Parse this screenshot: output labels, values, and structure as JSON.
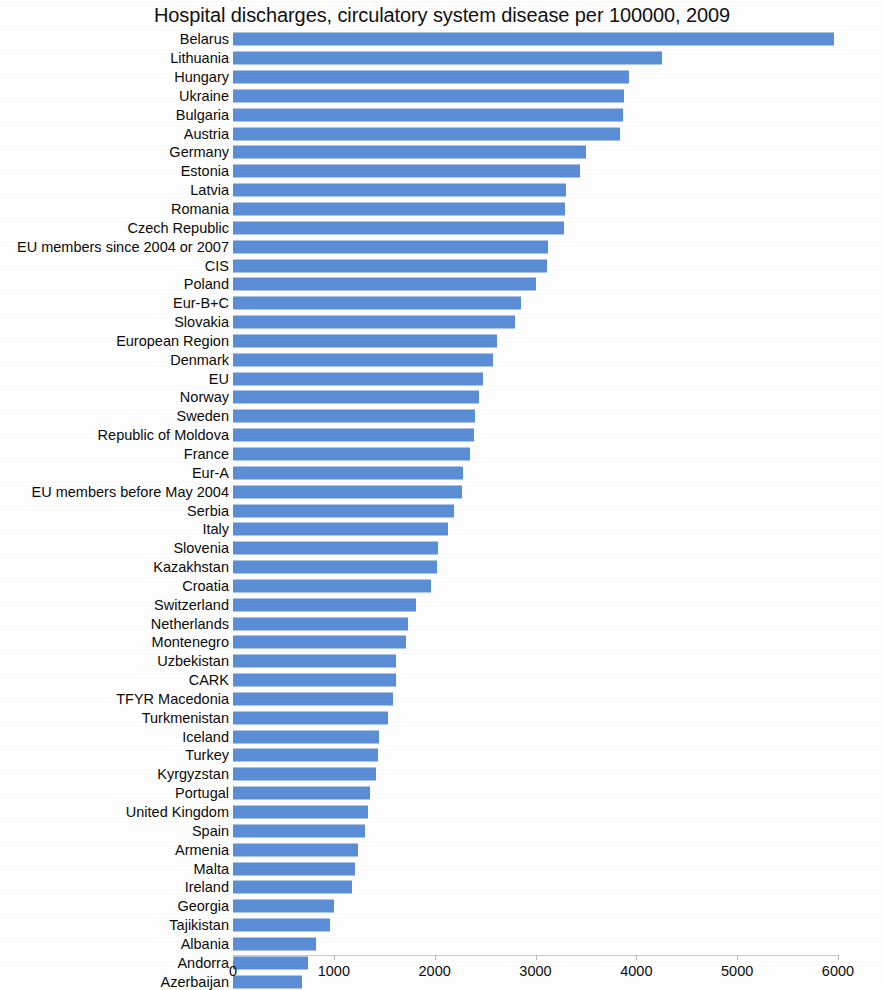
{
  "chart_data": {
    "type": "bar",
    "orientation": "horizontal",
    "title": "Hospital discharges, circulatory system disease per 100000, 2009",
    "xlabel": "",
    "ylabel": "",
    "xlim": [
      0,
      6000
    ],
    "xticks": [
      0,
      1000,
      2000,
      3000,
      4000,
      5000,
      6000
    ],
    "xtick_labels": [
      "0",
      "1000",
      "2000",
      "3000",
      "4000",
      "5000",
      "6000"
    ],
    "grid": false,
    "legend": "none",
    "bar_color": "#5b8ed6",
    "categories": [
      "Belarus",
      "Lithuania",
      "Hungary",
      "Ukraine",
      "Bulgaria",
      "Austria",
      "Germany",
      "Estonia",
      "Latvia",
      "Romania",
      "Czech Republic",
      "EU members since 2004 or 2007",
      "CIS",
      "Poland",
      "Eur-B+C",
      "Slovakia",
      "European Region",
      "Denmark",
      "EU",
      "Norway",
      "Sweden",
      "Republic of Moldova",
      "France",
      "Eur-A",
      "EU members before May 2004",
      "Serbia",
      "Italy",
      "Slovenia",
      "Kazakhstan",
      "Croatia",
      "Switzerland",
      "Netherlands",
      "Montenegro",
      "Uzbekistan",
      "CARK",
      "TFYR Macedonia",
      "Turkmenistan",
      "Iceland",
      "Turkey",
      "Kyrgyzstan",
      "Portugal",
      "United Kingdom",
      "Spain",
      "Armenia",
      "Malta",
      "Ireland",
      "Georgia",
      "Tajikistan",
      "Albania",
      "Andorra",
      "Azerbaijan"
    ],
    "values": [
      5960,
      4250,
      3930,
      3880,
      3870,
      3840,
      3500,
      3440,
      3300,
      3290,
      3280,
      3120,
      3110,
      3000,
      2860,
      2800,
      2620,
      2580,
      2480,
      2440,
      2400,
      2390,
      2350,
      2280,
      2270,
      2190,
      2130,
      2030,
      2020,
      1960,
      1810,
      1740,
      1720,
      1620,
      1620,
      1590,
      1540,
      1450,
      1440,
      1420,
      1360,
      1340,
      1310,
      1240,
      1210,
      1180,
      1000,
      960,
      820,
      740,
      680
    ]
  }
}
